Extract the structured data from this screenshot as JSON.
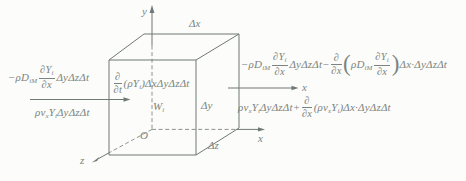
{
  "colors": {
    "ink": "#7b8480",
    "line": "#6f7976",
    "paper": "#fcfcfa"
  },
  "axes": {
    "y_label": "y",
    "z_label": "z",
    "origin_label": "O",
    "x_axis_label": "x",
    "x_flux_direction_label": "x"
  },
  "dimensions": {
    "dx": "Δx",
    "dy": "Δy",
    "dz": "Δz"
  },
  "source_term": {
    "base": "W",
    "sub": "i"
  },
  "equations": {
    "left_diffusion_in": {
      "coef": "−ρD",
      "coef_sub": "iM",
      "num": "∂Y",
      "num_sub": "i",
      "den": "∂x",
      "tail": "ΔyΔzΔt"
    },
    "left_convection_in": {
      "rho_v": "ρv",
      "v_sub": "x",
      "species": "Y",
      "species_sub": "i",
      "tail": "ΔyΔzΔt"
    },
    "storage": {
      "num": "∂",
      "den": "∂t",
      "open": "(",
      "rho_y": "ρY",
      "y_sub": "i",
      "close": ")",
      "tail": "ΔxΔyΔzΔt"
    },
    "right_diffusion_out": {
      "coef": "−ρD",
      "coef_sub": "iM",
      "num": "∂Y",
      "num_sub": "i",
      "den": "∂x",
      "tail1": "ΔyΔzΔt",
      "minus": "−",
      "d_num": "∂",
      "d_den": "∂x",
      "open": "(",
      "coef2": "ρD",
      "coef2_sub": "iM",
      "num2": "∂Y",
      "num2_sub": "i",
      "den2": "∂x",
      "close": ")",
      "tail2": "Δx·ΔyΔzΔt"
    },
    "right_convection_out": {
      "rho_v": "ρv",
      "v_sub": "x",
      "species": "Y",
      "species_sub": "i",
      "tail1": "ΔyΔzΔt",
      "plus": "+",
      "d_num": "∂",
      "d_den": "∂x",
      "open": "(",
      "rho_v2": "ρv",
      "v2_sub": "x",
      "species2": "Y",
      "species2_sub": "i",
      "close": ")",
      "tail2": "Δx·ΔyΔzΔt"
    }
  }
}
